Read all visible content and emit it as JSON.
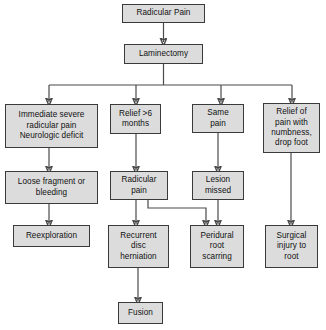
{
  "diagram": {
    "background_color": "#ffffff",
    "node_fill_color": "#dcdcdc",
    "node_border_color": "#3a3a3a",
    "edge_color": "#4a4a4a"
  },
  "nodes": {
    "radicular_pain": "Radicular Pain",
    "laminectomy": "Laminectomy",
    "immediate_severe": "Immediate severe\nradicular pain\nNeurologic deficit",
    "relief_6_months": "Relief >6\nmonths",
    "same_pain": "Same\npain",
    "relief_numbness": "Relief of\npain with\nnumbness,\ndrop foot",
    "loose_fragment": "Loose fragment or\nbleeding",
    "radicular_pain_2": "Radicular\npain",
    "lesion_missed": "Lesion\nmissed",
    "reexploration": "Reexploration",
    "recurrent_disc": "Recurrent\ndisc\nherniation",
    "peridural_scarring": "Peridural\nroot\nscarring",
    "surgical_injury": "Surgical\ninjury to\nroot",
    "fusion": "Fusion"
  }
}
